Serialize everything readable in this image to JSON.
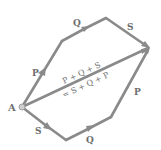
{
  "diagram": {
    "type": "vector-addition",
    "colors": {
      "arrow": "#8a8a8a",
      "text": "#6e6e6e",
      "point": "#b0b0b0"
    },
    "point": {
      "label": "A"
    },
    "top_path": [
      {
        "label": "P"
      },
      {
        "label": "Q"
      },
      {
        "label": "S"
      }
    ],
    "bottom_path": [
      {
        "label": "S"
      },
      {
        "label": "Q"
      },
      {
        "label": "P"
      }
    ],
    "resultant": {
      "line1": "P + Q + S",
      "line2": "= S + Q + P"
    }
  }
}
